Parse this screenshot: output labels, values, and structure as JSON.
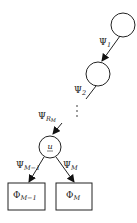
{
  "diagram": {
    "nodes": [
      {
        "id": "node-1",
        "shape": "circle",
        "label": ""
      },
      {
        "id": "node-2",
        "shape": "circle",
        "label": ""
      },
      {
        "id": "node-u",
        "shape": "circle",
        "label": "u"
      },
      {
        "id": "leaf-m-minus-1",
        "shape": "box",
        "label": "Φ",
        "sub": "M−1"
      },
      {
        "id": "leaf-m",
        "shape": "box",
        "label": "Φ",
        "sub": "M"
      }
    ],
    "edges": [
      {
        "from": "node-1",
        "to": "node-2",
        "label": "Ψ",
        "sub": "1"
      },
      {
        "from": "node-2",
        "to": "ellipsis",
        "label": "Ψ",
        "sub": "2"
      },
      {
        "from": "ellipsis",
        "to": "node-u",
        "label": "Ψ",
        "sub": "R",
        "subsub": "M"
      },
      {
        "from": "node-u",
        "to": "leaf-m-minus-1",
        "label": "Ψ",
        "sub": "M−1"
      },
      {
        "from": "node-u",
        "to": "leaf-m",
        "label": "Ψ",
        "sub": "M"
      }
    ],
    "ellipsis": "⋮"
  }
}
